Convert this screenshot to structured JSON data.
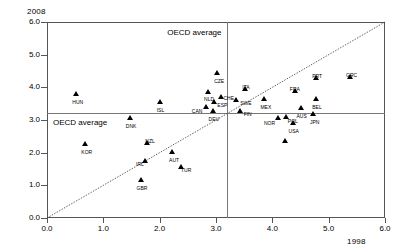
{
  "chart_data": {
    "type": "scatter",
    "title": "",
    "xlabel": "1998",
    "ylabel": "2008",
    "xlim": [
      0.0,
      6.0
    ],
    "ylim": [
      0.0,
      6.0
    ],
    "grid": false,
    "legend": null,
    "xticks": [
      "0.0",
      "1.0",
      "2.0",
      "3.0",
      "4.0",
      "5.0",
      "6.0"
    ],
    "yticks": [
      "0.0",
      "1.0",
      "2.0",
      "3.0",
      "4.0",
      "5.0",
      "6.0"
    ],
    "annotations": [
      {
        "text": "OECD average",
        "role": "vertical-reference-caption"
      },
      {
        "text": "OECD average",
        "role": "horizontal-reference-caption"
      }
    ],
    "reference_lines": {
      "oecd_average_x": 3.2,
      "oecd_average_y": 3.2,
      "identity_line": "y = x"
    },
    "points": [
      {
        "label": "HUN",
        "x": 0.52,
        "y": 3.78
      },
      {
        "label": "DNK",
        "x": 1.47,
        "y": 3.02
      },
      {
        "label": "KOR",
        "x": 0.68,
        "y": 2.23
      },
      {
        "label": "ISL",
        "x": 2.0,
        "y": 3.52
      },
      {
        "label": "CZE",
        "x": 3.02,
        "y": 4.42
      },
      {
        "label": "NLD",
        "x": 2.86,
        "y": 3.84
      },
      {
        "label": "CHE",
        "x": 3.08,
        "y": 3.66
      },
      {
        "label": "ESP",
        "x": 2.97,
        "y": 3.52
      },
      {
        "label": "CAN",
        "x": 2.82,
        "y": 3.36
      },
      {
        "label": "DEU",
        "x": 2.94,
        "y": 3.26
      },
      {
        "label": "ITA",
        "x": 3.52,
        "y": 3.92
      },
      {
        "label": "SWE",
        "x": 3.36,
        "y": 3.58
      },
      {
        "label": "MEX",
        "x": 3.86,
        "y": 3.62
      },
      {
        "label": "FRA",
        "x": 4.4,
        "y": 3.86
      },
      {
        "label": "PRT",
        "x": 4.78,
        "y": 4.26
      },
      {
        "label": "GRC",
        "x": 5.38,
        "y": 4.3
      },
      {
        "label": "BEL",
        "x": 4.78,
        "y": 3.62
      },
      {
        "label": "FIN",
        "x": 3.42,
        "y": 3.26
      },
      {
        "label": "AUS",
        "x": 4.5,
        "y": 3.34
      },
      {
        "label": "JPN",
        "x": 4.72,
        "y": 3.16
      },
      {
        "label": "NOR",
        "x": 4.1,
        "y": 3.02
      },
      {
        "label": "POL",
        "x": 4.24,
        "y": 3.06
      },
      {
        "label": "USA",
        "x": 4.36,
        "y": 2.88
      },
      {
        "label": "AUT",
        "x": 2.22,
        "y": 1.98
      },
      {
        "label": "NZL",
        "x": 1.78,
        "y": 2.28
      },
      {
        "label": "IRL",
        "x": 1.74,
        "y": 1.72
      },
      {
        "label": "TUR",
        "x": 2.38,
        "y": 1.52
      },
      {
        "label": "GBR",
        "x": 1.66,
        "y": 1.12
      },
      {
        "label": "",
        "x": 4.22,
        "y": 2.34
      }
    ]
  }
}
